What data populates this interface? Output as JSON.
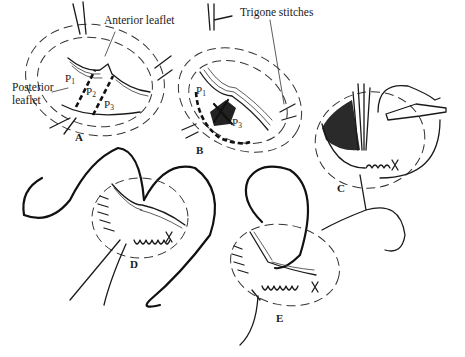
{
  "figure": {
    "labels": {
      "anterior_leaflet": "Anterior leaflet",
      "posterior_leaflet_line1": "Posterior",
      "posterior_leaflet_line2": "leaflet",
      "trigone_stitches": "Trigone stitches"
    },
    "segments": {
      "p1_base": "P",
      "p1_sub": "1",
      "p2_base": "P",
      "p2_sub": "2",
      "p3_base": "P",
      "p3_sub": "3"
    },
    "panels": [
      {
        "id": "A",
        "label": "A"
      },
      {
        "id": "B",
        "label": "B"
      },
      {
        "id": "C",
        "label": "C"
      },
      {
        "id": "D",
        "label": "D"
      },
      {
        "id": "E",
        "label": "E"
      }
    ]
  }
}
